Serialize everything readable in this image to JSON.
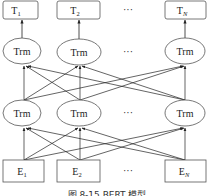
{
  "diagram": {
    "title": "BERT 模型",
    "caption": "图 8-15   BERT 模型",
    "outputs": [
      {
        "base": "T",
        "sub": "1"
      },
      {
        "base": "T",
        "sub": "2"
      },
      {
        "base": "T",
        "sub": "N"
      }
    ],
    "upper_layer": [
      "Trm",
      "Trm",
      "Trm"
    ],
    "lower_layer": [
      "Trm",
      "Trm",
      "Trm"
    ],
    "inputs": [
      {
        "base": "E",
        "sub": "1"
      },
      {
        "base": "E",
        "sub": "2"
      },
      {
        "base": "E",
        "sub": "N"
      }
    ],
    "ellipsis": "···",
    "colors": {
      "stroke": "#555555",
      "text": "#222222",
      "background": "#ffffff"
    }
  }
}
